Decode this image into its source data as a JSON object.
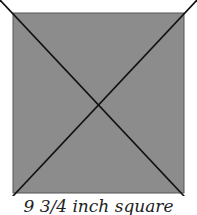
{
  "diagram": {
    "shape": "square",
    "fill_color": "#8c8c8c",
    "stroke_color": "#111111",
    "diagonals": 2,
    "caption": "9 3/4 inch square"
  }
}
